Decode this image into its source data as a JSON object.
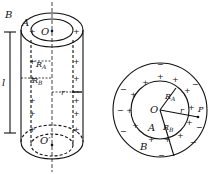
{
  "cylinder": {
    "labels": {
      "outer": "B",
      "inner": "A",
      "top_center": "O",
      "bottom_center": "O′",
      "length": "l",
      "radius_a": "R",
      "radius_a_sub": "A",
      "radius_b": "R",
      "radius_b_sub": "B",
      "r": "r"
    }
  },
  "cross_section": {
    "labels": {
      "center": "O",
      "radius_a": "R",
      "radius_a_sub": "A",
      "radius_b": "R",
      "radius_b_sub": "B",
      "r": "r",
      "point": "P",
      "inner": "A",
      "outer": "B"
    },
    "plus": "+",
    "minus": "−"
  }
}
